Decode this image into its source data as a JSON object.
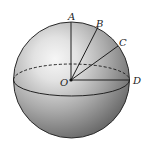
{
  "diagram": {
    "type": "sphere-with-radii",
    "center_label": "O",
    "points": [
      {
        "id": "A",
        "label": "A"
      },
      {
        "id": "B",
        "label": "B"
      },
      {
        "id": "C",
        "label": "C"
      },
      {
        "id": "D",
        "label": "D"
      }
    ],
    "segments": [
      "OA",
      "OB",
      "OC",
      "OD"
    ],
    "equator": {
      "style": "front solid, back dashed"
    },
    "colors": {
      "sphere_dark": "#5a5a5a",
      "sphere_light": "#f4f4f4",
      "line": "#1e1e1e",
      "label": "#222222"
    }
  }
}
